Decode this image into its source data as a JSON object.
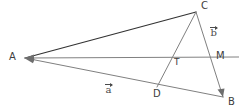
{
  "figure": {
    "type": "geometry-diagram",
    "width": 239,
    "height": 109,
    "background_color": "#ffffff",
    "stroke_dark": "#333333",
    "stroke_gray": "#808080",
    "label_color": "#4a4a4a"
  },
  "points": [
    {
      "id": "A",
      "label": "A",
      "x": 25,
      "y": 58,
      "label_x": 9,
      "label_y": 53
    },
    {
      "id": "C",
      "label": "C",
      "x": 196,
      "y": 12,
      "label_x": 201,
      "label_y": 2
    },
    {
      "id": "B",
      "label": "B",
      "x": 223,
      "y": 97,
      "label_x": 228,
      "label_y": 98
    },
    {
      "id": "D",
      "label": "D",
      "x": 158,
      "y": 86,
      "label_x": 154,
      "label_y": 90
    },
    {
      "id": "M",
      "label": "M",
      "x": 212,
      "y": 57,
      "label_x": 216,
      "label_y": 52
    },
    {
      "id": "T",
      "label": "T",
      "x": 173,
      "y": 57,
      "label_x": 174,
      "label_y": 59
    }
  ],
  "segments": [
    {
      "name": "A-to-C",
      "from": "A",
      "to": "C",
      "color": "#333333",
      "width": 1.2,
      "arrow": "none"
    },
    {
      "name": "A-to-B",
      "from": "A",
      "to": "B",
      "color": "#808080",
      "width": 1.0,
      "arrow": "start"
    },
    {
      "name": "A-to-M",
      "from": "M",
      "to": "A",
      "color": "#808080",
      "width": 1.0,
      "arrow": "end"
    },
    {
      "name": "C-to-B",
      "from": "C",
      "to": "B",
      "color": "#808080",
      "width": 1.0,
      "arrow": "end"
    },
    {
      "name": "C-to-D",
      "from": "C",
      "to": "D",
      "color": "#808080",
      "width": 1.0,
      "arrow": "none"
    }
  ],
  "vectors": [
    {
      "id": "a",
      "label": "a",
      "label_x": 105,
      "label_y": 84,
      "along": "A-to-B"
    },
    {
      "id": "b",
      "label": "b",
      "label_x": 210,
      "label_y": 27,
      "along": "C-to-B"
    }
  ]
}
